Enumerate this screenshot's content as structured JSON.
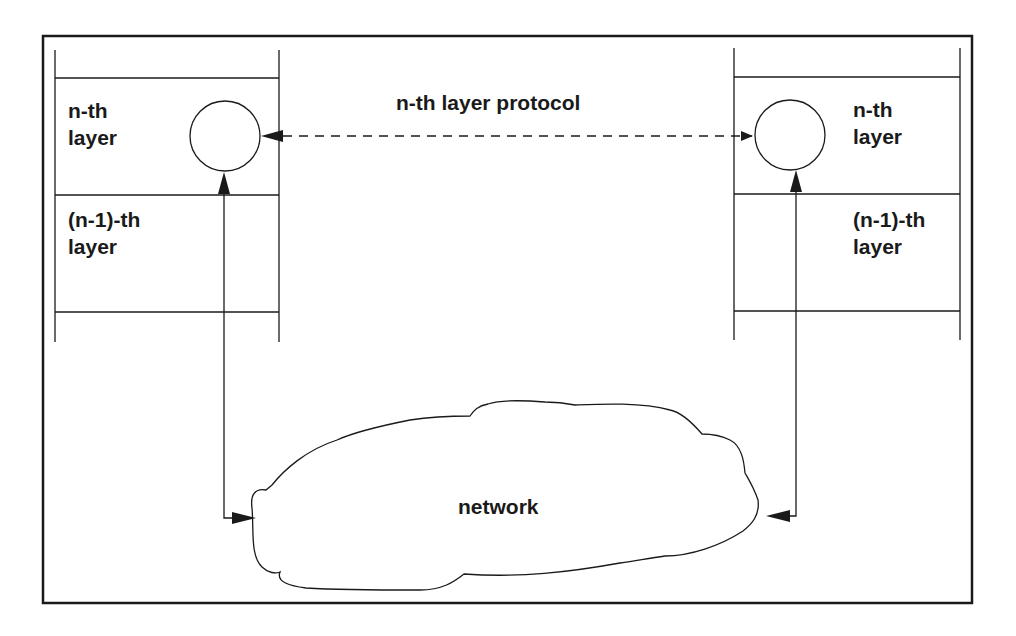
{
  "diagram": {
    "title": "n-th layer protocol",
    "left_stack": {
      "upper_layer_label": [
        "n-th",
        "layer"
      ],
      "lower_layer_label": [
        "(n-1)-th",
        "layer"
      ]
    },
    "right_stack": {
      "upper_layer_label": [
        "n-th",
        "layer"
      ],
      "lower_layer_label": [
        "(n-1)-th",
        "layer"
      ]
    },
    "network_label": "network",
    "connections": [
      {
        "from": "left-entity",
        "to": "right-entity",
        "style": "dashed",
        "label": "n-th layer protocol",
        "arrows": "both"
      },
      {
        "from": "network",
        "to": "left-entity",
        "style": "solid",
        "arrows": "both"
      },
      {
        "from": "network",
        "to": "right-entity",
        "style": "solid",
        "arrows": "both"
      }
    ],
    "colors": {
      "stroke": "#1a1a1a",
      "background": "#ffffff"
    }
  }
}
